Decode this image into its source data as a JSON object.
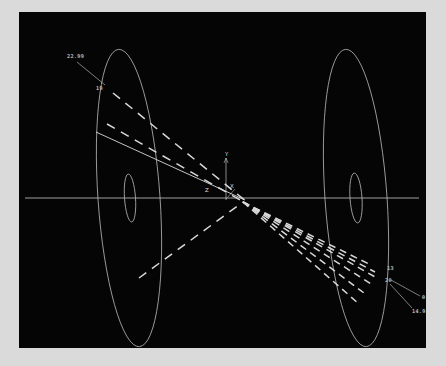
{
  "figure": {
    "background_color": "#050505",
    "page_color": "#dadada",
    "line_color": "#b9b9b9",
    "ray_color": "#d8d8d8",
    "text_color": "#cfcfcf",
    "plot_rect": {
      "x": 19,
      "y": 12,
      "width": 407,
      "height": 336
    }
  },
  "axes": {
    "origin": {
      "x": 207,
      "y": 174
    },
    "labels": [
      {
        "name": "y-axis-label",
        "text": "Y",
        "x": 206,
        "y": 140
      },
      {
        "name": "x-axis-label",
        "text": "X",
        "x": 211,
        "y": 172
      },
      {
        "name": "z-axis-label",
        "text": "Z",
        "x": 186,
        "y": 176
      }
    ],
    "optical_axis": {
      "y": 186,
      "x_start": 6,
      "x_end": 400
    }
  },
  "elements": {
    "surfaces": [
      {
        "name": "left-aperture-ellipse",
        "cx": 110,
        "cy": 186,
        "rx": 31,
        "ry": 149,
        "rotate": -4
      },
      {
        "name": "left-inner-ellipse",
        "cx": 111,
        "cy": 186,
        "rx": 5.5,
        "ry": 24,
        "rotate": -4
      },
      {
        "name": "right-aperture-ellipse",
        "cx": 337,
        "cy": 186,
        "rx": 31,
        "ry": 149,
        "rotate": -4
      },
      {
        "name": "right-inner-ellipse",
        "cx": 337,
        "cy": 186,
        "rx": 6,
        "ry": 25,
        "rotate": -4
      }
    ]
  },
  "rays": {
    "incoming": [
      {
        "name": "ray-in-1",
        "x1": 94,
        "y1": 81,
        "x2": 228,
        "y2": 190,
        "dashed": true
      },
      {
        "name": "ray-in-2",
        "x1": 88,
        "y1": 112,
        "x2": 228,
        "y2": 192,
        "dashed": true
      },
      {
        "name": "ray-in-3",
        "x1": 77,
        "y1": 120,
        "x2": 226,
        "y2": 188,
        "dashed": false
      },
      {
        "name": "ray-in-4",
        "x1": 120,
        "y1": 266,
        "x2": 224,
        "y2": 190,
        "dashed": true
      }
    ],
    "outgoing_fan": [
      {
        "name": "ray-out-1",
        "x1": 224,
        "y1": 190,
        "x2": 352,
        "y2": 253,
        "dashed": true
      },
      {
        "name": "ray-out-2",
        "x1": 224,
        "y1": 190,
        "x2": 356,
        "y2": 260,
        "dashed": true
      },
      {
        "name": "ray-out-3",
        "x1": 224,
        "y1": 190,
        "x2": 358,
        "y2": 266,
        "dashed": true
      },
      {
        "name": "ray-out-4",
        "x1": 224,
        "y1": 190,
        "x2": 352,
        "y2": 272,
        "dashed": true
      },
      {
        "name": "ray-out-5",
        "x1": 224,
        "y1": 190,
        "x2": 345,
        "y2": 281,
        "dashed": true
      },
      {
        "name": "ray-out-6",
        "x1": 224,
        "y1": 190,
        "x2": 340,
        "y2": 292,
        "dashed": true
      }
    ]
  },
  "annotations": [
    {
      "name": "annotation-upper-value",
      "text": "22.99",
      "x": 48,
      "y": 42,
      "leader": {
        "x1": 58,
        "y1": 50,
        "x2": 86,
        "y2": 73
      }
    },
    {
      "name": "annotation-upper-index",
      "text": "19",
      "x": 77,
      "y": 74
    },
    {
      "name": "annotation-lower-index",
      "text": "13",
      "x": 368,
      "y": 254
    },
    {
      "name": "annotation-lower-index2",
      "text": "20",
      "x": 366,
      "y": 266,
      "leader": {
        "x1": 372,
        "y1": 268,
        "x2": 401,
        "y2": 284
      }
    },
    {
      "name": "annotation-lower-value-1",
      "text": "0.64",
      "x": 403,
      "y": 283
    },
    {
      "name": "annotation-lower-value-2",
      "text": "14.93",
      "x": 393,
      "y": 297,
      "leader": {
        "x1": 371,
        "y1": 272,
        "x2": 393,
        "y2": 296
      }
    }
  ]
}
